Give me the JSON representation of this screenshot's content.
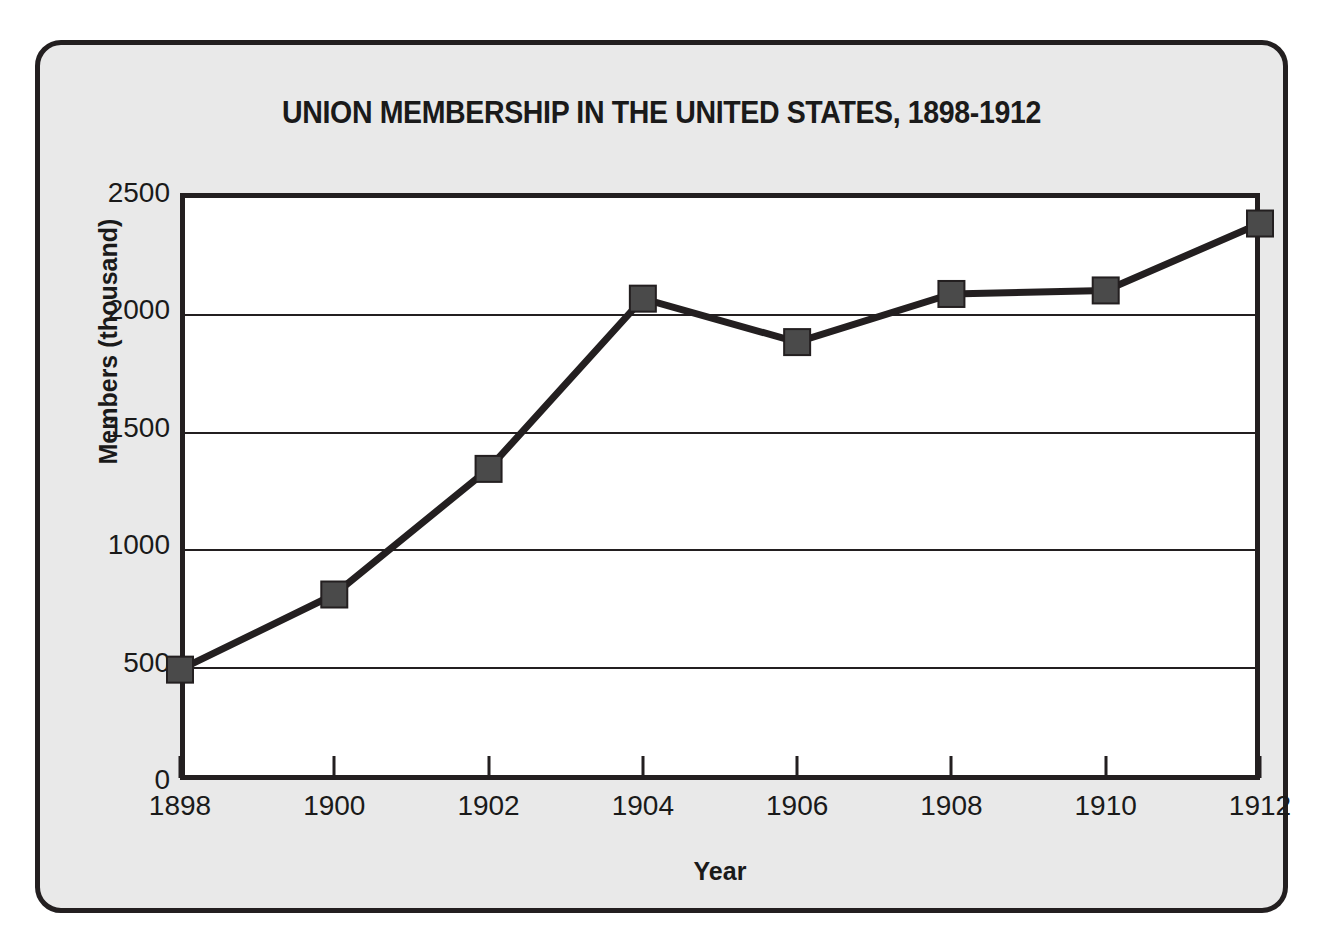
{
  "chart_data": {
    "type": "line",
    "title": "UNION MEMBERSHIP IN THE UNITED STATES, 1898-1912",
    "xlabel": "Year",
    "ylabel": "Members (thousand)",
    "categories": [
      "1898",
      "1900",
      "1902",
      "1904",
      "1906",
      "1908",
      "1910",
      "1912"
    ],
    "x": [
      1898,
      1900,
      1902,
      1904,
      1906,
      1908,
      1910,
      1912
    ],
    "values": [
      470,
      790,
      1325,
      2050,
      1865,
      2070,
      2085,
      2370
    ],
    "series": [
      {
        "name": "Union members",
        "values": [
          470,
          790,
          1325,
          2050,
          1865,
          2070,
          2085,
          2370
        ]
      }
    ],
    "ylim": [
      0,
      2500
    ],
    "xlim": [
      1898,
      1912
    ],
    "yticks": [
      0,
      500,
      1000,
      1500,
      2000,
      2500
    ],
    "ytick_labels": [
      "0",
      "500",
      "1000",
      "1500",
      "2000",
      "2500"
    ],
    "xticks": [
      1898,
      1900,
      1902,
      1904,
      1906,
      1908,
      1910,
      1912
    ],
    "xtick_labels": [
      "1898",
      "1900",
      "1902",
      "1904",
      "1906",
      "1908",
      "1910",
      "1912"
    ],
    "grid": "horizontal",
    "legend": "none",
    "marker": "square",
    "line_color": "#231f20",
    "marker_color": "#4a4a4a",
    "plot_background": "#ffffff",
    "frame_background": "#e9e9e9",
    "axis_color": "#231f20"
  }
}
